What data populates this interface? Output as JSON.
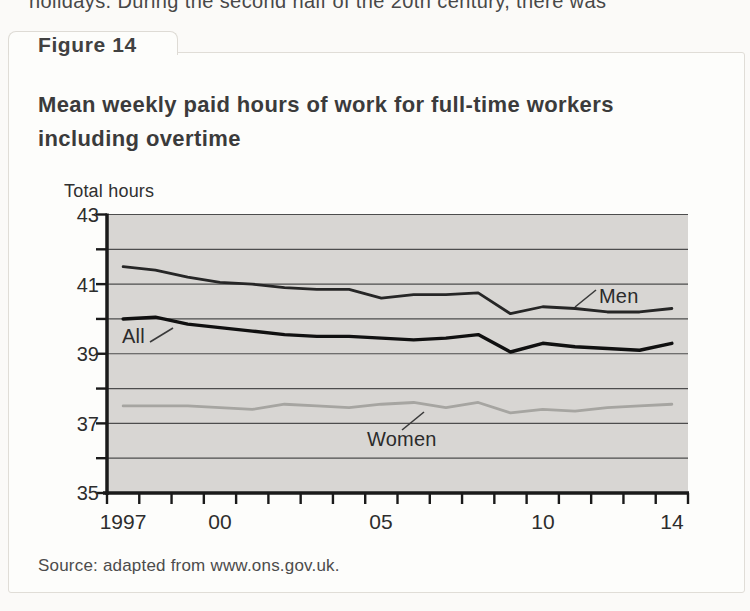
{
  "page": {
    "top_text": "holidays. During the second half of the 20th century, there was"
  },
  "figure": {
    "tab_label": "Figure 14",
    "title_line1": "Mean weekly paid hours of work for full-time workers",
    "title_line2": "including overtime",
    "source": "Source: adapted from www.ons.gov.uk."
  },
  "chart_data": {
    "type": "line",
    "ylabel": "Total hours",
    "xlabel": "",
    "ylim": [
      35,
      43
    ],
    "xlim": [
      1997,
      2014
    ],
    "grid": true,
    "legend_position": "inline-labels-on-lines",
    "gridline_values": [
      43,
      42,
      41,
      40,
      39,
      38,
      37,
      36
    ],
    "ytick_values": [
      43,
      41,
      39,
      37,
      35
    ],
    "ytick_labels": [
      "43",
      "41",
      "39",
      "37",
      "35"
    ],
    "xtick_labels": [
      "1997",
      "00",
      "05",
      "10",
      "14"
    ],
    "xtick_years": [
      1997,
      2000,
      2005,
      2010,
      2014
    ],
    "x": [
      1997,
      1998,
      1999,
      2000,
      2001,
      2002,
      2003,
      2004,
      2005,
      2006,
      2007,
      2008,
      2009,
      2010,
      2011,
      2012,
      2013,
      2014
    ],
    "series": [
      {
        "name": "Men",
        "color": "#262626",
        "values": [
          41.5,
          41.4,
          41.2,
          41.05,
          41.0,
          40.9,
          40.85,
          40.85,
          40.6,
          40.7,
          40.7,
          40.75,
          40.15,
          40.35,
          40.3,
          40.2,
          40.2,
          40.3
        ]
      },
      {
        "name": "All",
        "color": "#101010",
        "values": [
          40.0,
          40.05,
          39.85,
          39.75,
          39.65,
          39.55,
          39.5,
          39.5,
          39.45,
          39.4,
          39.45,
          39.55,
          39.05,
          39.3,
          39.2,
          39.15,
          39.1,
          39.3
        ]
      },
      {
        "name": "Women",
        "color": "#a6a5a1",
        "values": [
          37.5,
          37.5,
          37.5,
          37.45,
          37.4,
          37.55,
          37.5,
          37.45,
          37.55,
          37.6,
          37.45,
          37.6,
          37.3,
          37.4,
          37.35,
          37.45,
          37.5,
          37.55
        ]
      }
    ],
    "source": "Source: adapted from www.ons.gov.uk."
  },
  "colors": {
    "plot_background": "#d8d6d3",
    "gridline": "#4d4d4d",
    "axis": "#1a1a1a",
    "figure_border": "#e0ddd7",
    "women_line": "#a6a5a1"
  }
}
